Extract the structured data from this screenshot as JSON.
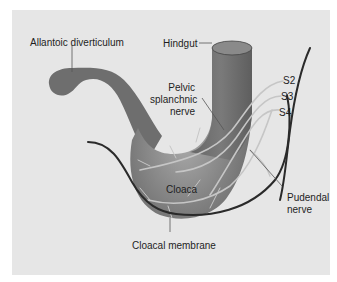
{
  "diagram": {
    "colors": {
      "background": "#e6e6e6",
      "gut_fill": "#6e6e6e",
      "gut_highlight": "#9a9a9a",
      "nerve": "#c4c4c4",
      "outline_curve": "#2a2a2a",
      "leader_line": "#555555",
      "text": "#1e1e1e"
    },
    "labels": {
      "allantoic": "Allantoic diverticulum",
      "hindgut": "Hindgut",
      "pelvic_line1": "Pelvic",
      "pelvic_line2": "splanchnic",
      "pelvic_line3": "nerve",
      "s2": "S2",
      "s3": "S3",
      "s4": "S4",
      "cloaca": "Cloaca",
      "pudendal_line1": "Pudendal",
      "pudendal_line2": "nerve",
      "cloacal_membrane": "Cloacal membrane"
    }
  }
}
